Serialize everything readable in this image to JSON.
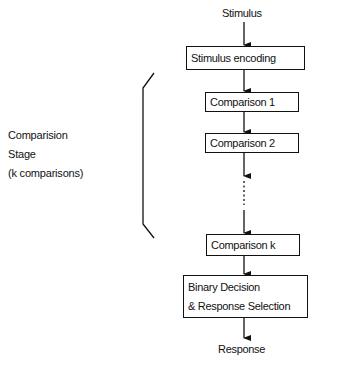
{
  "diagram": {
    "clipped_caption": "",
    "top_label": "Stimulus",
    "nodes": [
      {
        "id": "encoding",
        "label": "Stimulus encoding"
      },
      {
        "id": "comparison1",
        "label": "Comparison 1"
      },
      {
        "id": "comparison2",
        "label": "Comparison 2"
      },
      {
        "id": "comparisonk",
        "label": "Comparison k"
      },
      {
        "id": "decision",
        "lines": [
          "Binary Decision",
          "& Response Selection"
        ]
      }
    ],
    "bottom_label": "Response",
    "stage_bracket": {
      "lines": [
        "Comparision",
        "Stage",
        "(k comparisons)"
      ]
    },
    "colors": {
      "stroke": "#111111",
      "background": "#ffffff"
    }
  }
}
